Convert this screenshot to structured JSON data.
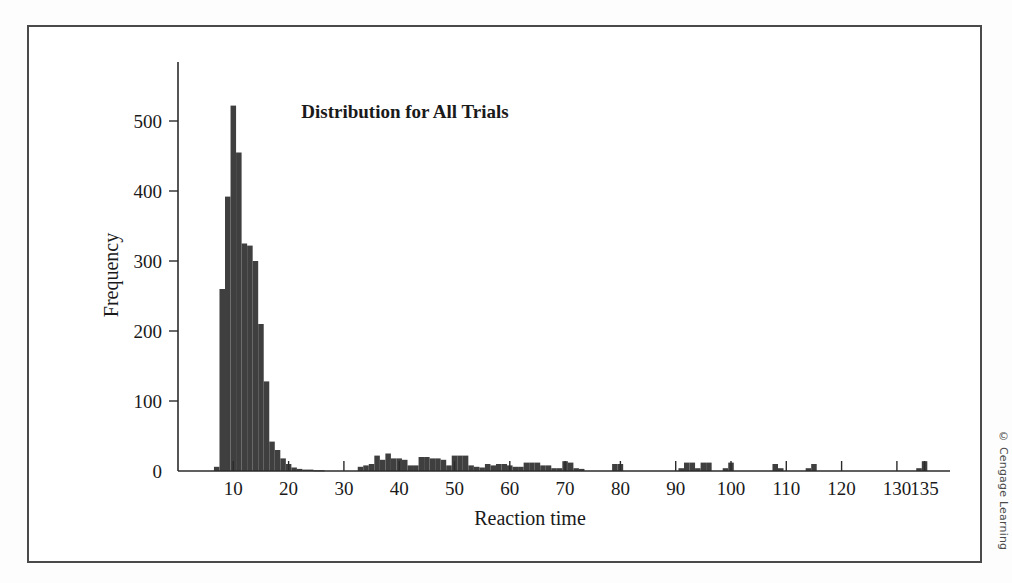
{
  "figure": {
    "credit": "© Cengage Learning"
  },
  "chart_data": {
    "type": "bar",
    "title": "Distribution for All Trials",
    "xlabel": "Reaction time",
    "ylabel": "Frequency",
    "xlim": [
      0,
      140
    ],
    "ylim": [
      0,
      560
    ],
    "grid": false,
    "legend": null,
    "bar_width": 1,
    "xticks": [
      10,
      20,
      30,
      40,
      50,
      60,
      70,
      80,
      90,
      100,
      110,
      120,
      130,
      135
    ],
    "xtick_labels": [
      "10",
      "20",
      "30",
      "40",
      "50",
      "60",
      "70",
      "80",
      "90",
      "100",
      "110",
      "120",
      "130",
      "135"
    ],
    "yticks": [
      0,
      100,
      200,
      300,
      400,
      500
    ],
    "ytick_labels": [
      "0",
      "100",
      "200",
      "300",
      "400",
      "500"
    ],
    "bar_color": "#3f3f3f",
    "x": [
      7,
      8,
      9,
      10,
      11,
      12,
      13,
      14,
      15,
      16,
      17,
      18,
      19,
      20,
      21,
      22,
      23,
      24,
      25,
      26,
      33,
      34,
      35,
      36,
      37,
      38,
      39,
      40,
      41,
      42,
      43,
      44,
      45,
      46,
      47,
      48,
      49,
      50,
      51,
      52,
      53,
      54,
      55,
      56,
      57,
      58,
      59,
      60,
      61,
      62,
      63,
      64,
      65,
      66,
      67,
      68,
      69,
      70,
      71,
      72,
      73,
      79,
      80,
      91,
      92,
      93,
      94,
      95,
      96,
      99,
      100,
      108,
      109,
      114,
      115,
      134,
      135
    ],
    "values": [
      6,
      260,
      392,
      522,
      455,
      325,
      322,
      300,
      210,
      128,
      42,
      30,
      18,
      10,
      5,
      3,
      2,
      2,
      1,
      1,
      6,
      8,
      10,
      22,
      16,
      25,
      18,
      18,
      16,
      8,
      8,
      20,
      20,
      18,
      18,
      16,
      8,
      22,
      22,
      22,
      8,
      6,
      5,
      10,
      8,
      10,
      10,
      8,
      6,
      6,
      12,
      12,
      12,
      8,
      8,
      4,
      4,
      14,
      12,
      4,
      3,
      10,
      10,
      4,
      12,
      12,
      4,
      12,
      12,
      4,
      12,
      10,
      4,
      4,
      10,
      4,
      14
    ]
  }
}
